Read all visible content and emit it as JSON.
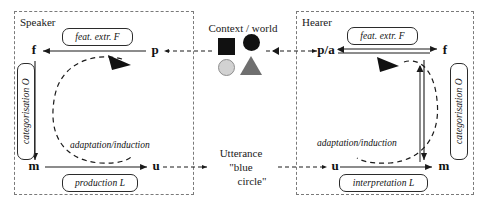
{
  "diagram": {
    "title_hidden": "",
    "speaker": {
      "frame_label": "Speaker",
      "nodes": {
        "f": "f",
        "p": "p",
        "m": "m",
        "u": "u"
      },
      "ops": {
        "feature_extraction": "feat. extr.  F",
        "categorisation": "categorisation  O",
        "production": "production  L"
      },
      "adaptation": "adaptation/induction"
    },
    "hearer": {
      "frame_label": "Hearer",
      "nodes": {
        "pa": "p/a",
        "f": "f",
        "m": "m",
        "u": "u"
      },
      "ops": {
        "feature_extraction": "feat. extr.  F",
        "categorisation": "categorisation  O",
        "interpretation": "interpretation  L"
      },
      "adaptation": "adaptation/induction"
    },
    "center": {
      "context_label": "Context / world",
      "utterance_label": "Utterance",
      "utterance_line1": "\"blue",
      "utterance_line2": "circle\"",
      "shapes": [
        {
          "name": "square",
          "fill": "#111111"
        },
        {
          "name": "circle-dark",
          "fill": "#111111"
        },
        {
          "name": "circle-light",
          "fill": "#d2d2d2"
        },
        {
          "name": "triangle",
          "fill": "#6f6f6f"
        }
      ]
    },
    "colors": {
      "frame_border": "#7a7a7a",
      "line": "#1a1a1a",
      "box_border": "#2b2b2b",
      "background": "#ffffff"
    }
  }
}
